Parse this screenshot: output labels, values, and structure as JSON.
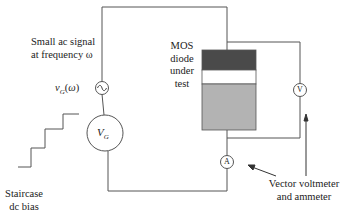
{
  "diagram": {
    "labels": {
      "ac_signal_line1": "Small ac signal",
      "ac_signal_line2": "at frequency ω",
      "vg_small": "v",
      "vg_small_sub": "G",
      "vg_small_arg": "(ω)",
      "vg_dc": "V",
      "vg_dc_sub": "G",
      "mos_line1": "MOS",
      "mos_line2": "diode",
      "mos_line3": "under",
      "mos_line4": "test",
      "voltmeter_symbol": "V",
      "ammeter_symbol": "A",
      "staircase_line1": "Staircase",
      "staircase_line2": "dc bias",
      "meter_line1": "Vector voltmeter",
      "meter_line2": "and ammeter"
    },
    "components": [
      {
        "id": "ac-source",
        "type": "ac-voltage-source",
        "symbol": "~"
      },
      {
        "id": "dc-source",
        "type": "dc-voltage-source",
        "label": "V_G"
      },
      {
        "id": "mos-diode",
        "type": "mos-capacitor",
        "layers": [
          "metal",
          "oxide",
          "semiconductor"
        ]
      },
      {
        "id": "voltmeter",
        "type": "meter",
        "symbol": "V"
      },
      {
        "id": "ammeter",
        "type": "meter",
        "symbol": "A"
      }
    ],
    "colors": {
      "wire": "#555555",
      "metal_layer": "#4a4a4a",
      "oxide_layer": "#ffffff",
      "semiconductor_layer": "#b3b3b3"
    }
  }
}
